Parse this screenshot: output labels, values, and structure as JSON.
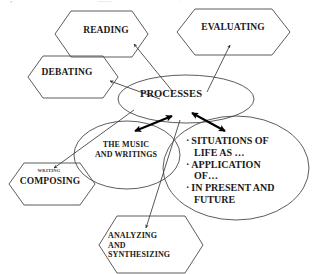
{
  "diagram": {
    "type": "concept-map",
    "colors": {
      "stroke": "#4a4a4a",
      "text": "#1a1a1a",
      "arrow_thin": "#3f3f3f",
      "arrow_bold": "#000000",
      "background": "#ffffff"
    },
    "ellipses": {
      "processes": {
        "label": "PROCESSES"
      },
      "music": {
        "label": "THE MUSIC\nAND WRITINGS"
      },
      "situations": {
        "bullets": [
          "SITUATIONS OF\nLIFE AS …",
          "APPLICATION\nOF…",
          "IN PRESENT AND\nFUTURE"
        ],
        "bullet_marker": "·"
      }
    },
    "hexagons": {
      "reading": {
        "label": "READING"
      },
      "evaluating": {
        "label": "EVALUATING"
      },
      "debating": {
        "label": "DEBATING"
      },
      "composing": {
        "sublabel": "WRITING",
        "label": "COMPOSING"
      },
      "analyzing": {
        "label": "ANALYZING\nAND\nSYNTHESIZING"
      }
    },
    "top_artifacts": [
      {
        "text": "•",
        "x": 12
      },
      {
        "text": "——",
        "x": 100
      },
      {
        "text": "·",
        "x": 180
      }
    ]
  }
}
